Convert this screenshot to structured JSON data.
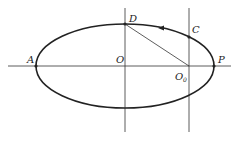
{
  "diagram": {
    "type": "ellipse-orbit",
    "labels": {
      "A": "A",
      "O": "O",
      "O0": "O",
      "O0_sub": "0",
      "P": "P",
      "C": "C",
      "D": "D"
    },
    "colors": {
      "stroke": "#222222",
      "background": "#ffffff"
    }
  }
}
